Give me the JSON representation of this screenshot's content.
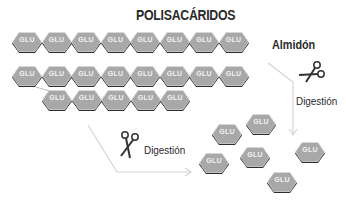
{
  "title": "POLISACÁRIDOS",
  "labels": {
    "starch": "Almidón",
    "digestion_right": "Digestión",
    "digestion_bottom": "Digestión"
  },
  "unit_label": "GLU",
  "colors": {
    "hex_fill": "#a8a8a8",
    "hex_border": "#d8d8d8",
    "hex_shadow": "#2e2e2e",
    "arrow": "#d4d4d4",
    "text": "#2a2a2a"
  },
  "rows": [
    {
      "name": "chain-1",
      "count": 8
    },
    {
      "name": "chain-2",
      "count": 8
    },
    {
      "name": "chain-3-branch",
      "count": 5
    }
  ],
  "free_units": 6
}
